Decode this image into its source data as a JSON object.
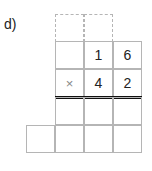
{
  "problem": {
    "label": "d)",
    "multiplicand": [
      "",
      "1",
      "6"
    ],
    "multiplier_row": [
      "×",
      "4",
      "2"
    ],
    "operator": "×"
  }
}
